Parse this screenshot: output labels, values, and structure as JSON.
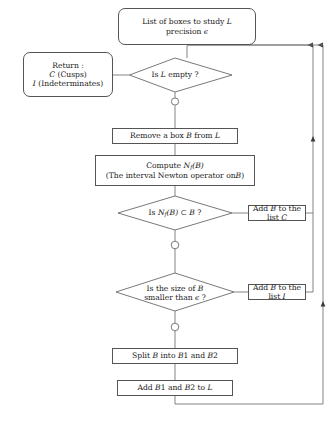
{
  "diagram": {
    "type": "flowchart",
    "colors": {
      "stroke": "#555555",
      "text": "#1a1a1a",
      "background": "#ffffff"
    },
    "nodes": {
      "start": {
        "shape": "rounded-rectangle",
        "line1_a": "List of boxes to study",
        "line1_b": "L",
        "line2_a": "precision",
        "line2_b": "ϵ"
      },
      "return": {
        "shape": "rounded-rectangle",
        "line1": "Return :",
        "line2_a": "C",
        "line2_b": "(Cusps)",
        "line3_a": "I",
        "line3_b": "(Indeterminates)"
      },
      "is_l_empty": {
        "shape": "diamond",
        "text_a": "Is",
        "text_b": "L",
        "text_c": "empty ?"
      },
      "remove_box": {
        "shape": "rectangle",
        "text_a": "Remove a box",
        "text_b": "B",
        "text_c": "from",
        "text_d": "L"
      },
      "compute_newton": {
        "shape": "rectangle",
        "line1_a": "Compute",
        "line1_b": "N",
        "line1_sub": "f",
        "line1_c": "(B)",
        "line2": "(The interval Newton operator on",
        "line2_b": "B",
        "line2_c": ")"
      },
      "is_newton_subset": {
        "shape": "diamond",
        "text_a": "Is",
        "text_b": "N",
        "text_sub": "f",
        "text_c": "(B)",
        "text_d": "⊂",
        "text_e": "B",
        "text_f": "?"
      },
      "add_to_c": {
        "shape": "rectangle",
        "text_a": "Add",
        "text_b": "B",
        "text_c": "to the list",
        "text_d": "C"
      },
      "is_size_small": {
        "shape": "diamond",
        "line1_a": "Is the size of",
        "line1_b": "B",
        "line2_a": "smaller than",
        "line2_b": "ϵ",
        "line2_c": "?"
      },
      "add_to_i": {
        "shape": "rectangle",
        "text_a": "Add",
        "text_b": "B",
        "text_c": "to the list",
        "text_d": "I"
      },
      "split_box": {
        "shape": "rectangle",
        "text_a": "Split",
        "text_b": "B",
        "text_c": "into",
        "text_d": "B",
        "text_e": "1 and",
        "text_f": "B",
        "text_g": "2"
      },
      "add_split_to_l": {
        "shape": "rectangle",
        "text_a": "Add",
        "text_b": "B",
        "text_c": "1 and",
        "text_d": "B",
        "text_e": "2 to",
        "text_f": "L"
      }
    }
  }
}
